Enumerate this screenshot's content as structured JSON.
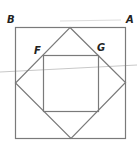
{
  "diagram": {
    "type": "nested squares geometry figure",
    "labels": {
      "B": "B",
      "A": "A",
      "F": "F",
      "G": "G"
    },
    "colors": {
      "stroke": "#7a7a7a",
      "label": "#222222",
      "faint_line": "#c8c8c8",
      "background": "#ffffff"
    },
    "shapes": {
      "outer_square": {
        "x1": 15,
        "y1": 27,
        "x2": 125,
        "y2": 138
      },
      "diamond": [
        [
          70,
          27
        ],
        [
          125,
          82
        ],
        [
          71,
          138
        ],
        [
          15,
          83
        ]
      ],
      "inner_square": {
        "x1": 43,
        "y1": 55,
        "x2": 98,
        "y2": 111
      }
    }
  }
}
